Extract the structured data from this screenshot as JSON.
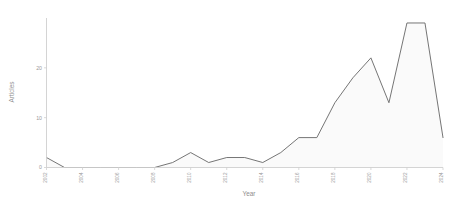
{
  "chart_data": {
    "type": "area",
    "title": "",
    "xlabel": "Year",
    "ylabel": "Articles",
    "grid": false,
    "legend": false,
    "xlim": [
      2002,
      2024
    ],
    "ylim": [
      0,
      30
    ],
    "yticks": [
      0,
      10,
      20
    ],
    "ytick_labels": [
      "0",
      "10",
      "20"
    ],
    "xticks": [
      2002,
      2004,
      2006,
      2008,
      2010,
      2012,
      2014,
      2016,
      2018,
      2020,
      2022,
      2024
    ],
    "xtick_labels": [
      "2002",
      "2004",
      "2006",
      "2008",
      "2010",
      "2012",
      "2014",
      "2016",
      "2018",
      "2020",
      "2022",
      "2024"
    ],
    "categories": [
      2002,
      2003,
      2004,
      2005,
      2006,
      2007,
      2008,
      2009,
      2010,
      2011,
      2012,
      2013,
      2014,
      2015,
      2016,
      2017,
      2018,
      2019,
      2020,
      2021,
      2022,
      2023,
      2024
    ],
    "values": [
      2,
      0,
      0,
      0,
      0,
      0,
      0,
      1,
      3,
      1,
      2,
      2,
      1,
      3,
      6,
      6,
      13,
      18,
      22,
      13,
      29,
      29,
      6
    ],
    "series": [
      {
        "name": "Articles",
        "values": [
          2,
          0,
          0,
          0,
          0,
          0,
          0,
          1,
          3,
          1,
          2,
          2,
          1,
          3,
          6,
          6,
          13,
          18,
          22,
          13,
          29,
          29,
          6
        ]
      }
    ],
    "line_color": "#6e6e6e",
    "fill_color": "#fafafa",
    "axis_color": "#cfcfcf",
    "tick_label_color": "#9a9a9a",
    "xtick_rotation": 90
  }
}
